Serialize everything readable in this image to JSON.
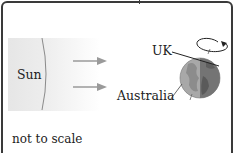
{
  "diagram": {
    "labels": {
      "sun": "Sun",
      "uk": "UK",
      "australia": "Australia",
      "note": "not to scale"
    },
    "elements": {
      "sun": "sun-edge-icon",
      "light_rays": [
        "light-ray-arrow-icon",
        "light-ray-arrow-icon"
      ],
      "earth": "earth-globe-icon",
      "rotation": "rotation-arrow-icon"
    },
    "colors": {
      "border": "#3a3a3a",
      "text": "#222222",
      "arrow": "#9a9a9a",
      "earth_lit": "#a8a8a8",
      "earth_dark": "#6e6e6e"
    }
  }
}
